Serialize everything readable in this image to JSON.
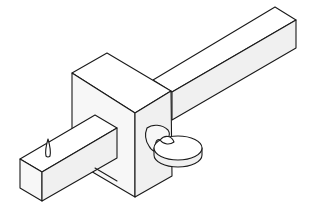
{
  "figure": {
    "subject": "Marking gauge",
    "parts": [
      "stem",
      "headstock",
      "thumbscrew",
      "marking pin"
    ],
    "colors": {
      "line": "#1a1a1a",
      "top_face": "#ffffff",
      "side_face": "#f0f0f0",
      "front_face": "#f7f7f7"
    }
  }
}
